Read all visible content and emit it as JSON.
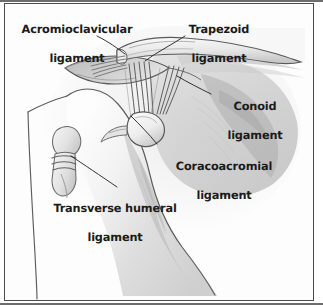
{
  "figure": {
    "style": "pencil sketch, grayscale",
    "frame_color": "#4a4a4a",
    "background_color": "#fdfdfd",
    "label_color": "#1b1b1b"
  },
  "labels": [
    {
      "id": "acromioclavicular",
      "text": "Acromioclavicular\nligament",
      "line1": "Acromioclavicular",
      "line2": "ligament"
    },
    {
      "id": "trapezoid",
      "text": "Trapezoid\nligament",
      "line1": "Trapezoid",
      "line2": "ligament"
    },
    {
      "id": "conoid",
      "text": "Conoid\nligament",
      "line1": "Conoid",
      "line2": "ligament"
    },
    {
      "id": "coracoacromial",
      "text": "Coracoacromial\nligament",
      "line1": "Coracoacromial",
      "line2": "ligament"
    },
    {
      "id": "transverse-humeral",
      "text": "Transverse humeral\nligament",
      "line1": "Transverse humeral",
      "line2": "ligament"
    }
  ],
  "anatomy": {
    "structures": [
      "clavicle",
      "acromion",
      "scapula",
      "humerus",
      "coracoid process",
      "deltoid outline",
      "acromioclavicular ligament fibers",
      "trapezoid ligament fibers",
      "conoid ligament fibers",
      "coracoacromial ligament band",
      "transverse humeral ligament"
    ]
  }
}
